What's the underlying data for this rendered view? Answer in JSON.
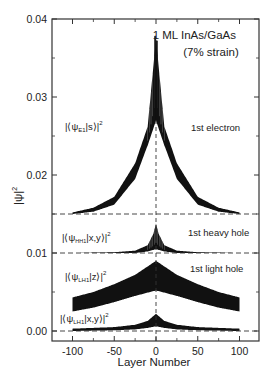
{
  "chart_data": {
    "type": "line",
    "title": "1 ML InAs/GaAs",
    "subtitle": "(7% strain)",
    "xlabel": "Layer Number",
    "ylabel": "|ψ|²",
    "xlim": [
      -120,
      125
    ],
    "ylim": [
      -0.0015,
      0.04
    ],
    "xticks": [
      -100,
      -50,
      0,
      50,
      100
    ],
    "xtick_labels": [
      "-100",
      "-50",
      "0",
      "50",
      "100"
    ],
    "yticks": [
      0.0,
      0.01,
      0.02,
      0.03,
      0.04
    ],
    "ytick_labels": [
      "0.00",
      "0.01",
      "0.02",
      "0.03",
      "0.04"
    ],
    "grid": false,
    "legend": "none (inline annotations)",
    "dashed_baselines": [
      0.015,
      0.01,
      0.0
    ],
    "vertical_dashed_line_x": 0,
    "series": [
      {
        "name": "1st electron",
        "component": "|⟨ψE1|s⟩|²",
        "baseline": 0.015,
        "x": [
          -100,
          -75,
          -50,
          -25,
          -10,
          0,
          10,
          25,
          50,
          75,
          100
        ],
        "upper": [
          0.0152,
          0.0158,
          0.0172,
          0.0215,
          0.0262,
          0.0375,
          0.0262,
          0.0215,
          0.0172,
          0.0158,
          0.0152
        ],
        "lower": [
          0.015,
          0.0153,
          0.0162,
          0.0195,
          0.0238,
          0.027,
          0.0238,
          0.0195,
          0.0162,
          0.0153,
          0.015
        ]
      },
      {
        "name": "1st heavy hole",
        "component": "|⟨ψHH1|x,y⟩|²",
        "baseline": 0.01,
        "x": [
          -100,
          -50,
          -25,
          -10,
          -3,
          0,
          3,
          10,
          25,
          50,
          100
        ],
        "upper": [
          0.01,
          0.0101,
          0.0103,
          0.011,
          0.0125,
          0.0138,
          0.0125,
          0.011,
          0.0103,
          0.0101,
          0.01
        ],
        "lower": [
          0.01,
          0.01,
          0.01,
          0.0102,
          0.0104,
          0.0105,
          0.0104,
          0.0102,
          0.01,
          0.01,
          0.01
        ]
      },
      {
        "name": "1st light hole",
        "component": "|⟨ψLH1|z⟩|²",
        "baseline": null,
        "x": [
          -100,
          -75,
          -50,
          -25,
          0,
          25,
          50,
          75,
          100
        ],
        "upper": [
          0.0043,
          0.005,
          0.006,
          0.0072,
          0.009,
          0.0072,
          0.006,
          0.005,
          0.0043
        ],
        "lower": [
          0.0025,
          0.003,
          0.0037,
          0.0045,
          0.0052,
          0.0045,
          0.0037,
          0.003,
          0.0025
        ]
      },
      {
        "name": "1st light hole (in-plane)",
        "component": "|⟨ψLH1|x,y⟩|²",
        "baseline": 0.0,
        "x": [
          -100,
          -50,
          -25,
          -10,
          0,
          10,
          25,
          50,
          100
        ],
        "upper": [
          0.0003,
          0.0005,
          0.0008,
          0.0013,
          0.0022,
          0.0013,
          0.0008,
          0.0005,
          0.0003
        ],
        "lower": [
          0.0,
          0.0001,
          0.0002,
          0.0004,
          0.0006,
          0.0004,
          0.0002,
          0.0001,
          0.0
        ]
      }
    ],
    "annotations": [
      {
        "text": "1st electron",
        "x": 78,
        "y": 0.0301
      },
      {
        "text": "1st heavy hole",
        "x": 75,
        "y": 0.0122
      },
      {
        "text": "1st light hole",
        "x": 76,
        "y": 0.0083
      },
      {
        "text": "|⟨ψE1|s⟩|²",
        "x": -95,
        "y": 0.027
      },
      {
        "text": "|⟨ψHH1|x,y⟩|²",
        "x": -105,
        "y": 0.0128
      },
      {
        "text": "|⟨ψLH1|z⟩|²",
        "x": -97,
        "y": 0.0077
      },
      {
        "text": "|⟨ψLH1|x,y⟩|²",
        "x": -103,
        "y": 0.0023
      }
    ]
  },
  "labels": {
    "title_line1": "1 ML InAs/GaAs",
    "title_line2": "(7% strain)",
    "xlabel": "Layer Number",
    "ylabel_base": "|ψ|",
    "ylabel_sup": "2",
    "electron": "1st electron",
    "heavy_hole": "1st heavy hole",
    "light_hole": "1st light hole"
  },
  "component_labels": {
    "e1_pre": "|⟨ψ",
    "e1_sub": "E1",
    "e1_post": "|s⟩|",
    "e1_sup": "2",
    "hh1_pre": "|⟨ψ",
    "hh1_sub": "HH1",
    "hh1_post": "|x,y⟩|",
    "hh1_sup": "2",
    "lh1z_pre": "|⟨ψ",
    "lh1z_sub": "LH1",
    "lh1z_post": "|z⟩|",
    "lh1z_sup": "2",
    "lh1xy_pre": "|⟨ψ",
    "lh1xy_sub": "LH1",
    "lh1xy_post": "|x,y⟩|",
    "lh1xy_sup": "2"
  },
  "colors": {
    "ink": "#111111",
    "axis": "#333333",
    "background": "#ffffff"
  }
}
